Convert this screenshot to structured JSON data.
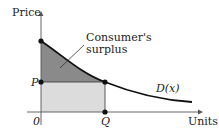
{
  "diagram": {
    "y_axis_label": "Price",
    "x_axis_label": "Units",
    "origin_label": "0",
    "price_label": "P",
    "quantity_label": "Q",
    "curve_label": "D(x)",
    "annotation_line1": "Consumer's",
    "annotation_line2": "surplus",
    "colors": {
      "surplus_fill": "#8a8a8a",
      "rectangle_fill": "#dcdcdc",
      "curve": "#111111",
      "axes": "#555555"
    }
  }
}
